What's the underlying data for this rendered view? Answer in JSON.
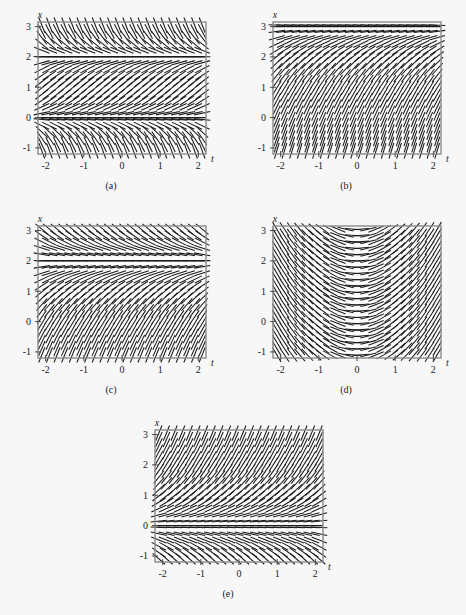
{
  "figure": {
    "background_color": "#f7f7f8",
    "frame_color": "#8a8a8a",
    "segment_color": "#1a1a1a",
    "axis_label_x": "x",
    "axis_label_t": "t"
  },
  "axes": {
    "x_ticks": [
      "-2",
      "-1",
      "0",
      "1",
      "2"
    ],
    "x_tick_values": [
      -2,
      -1,
      0,
      1,
      2
    ],
    "y_ticks": [
      "-1",
      "0",
      "1",
      "2",
      "3"
    ],
    "y_tick_values": [
      -1,
      0,
      1,
      2,
      3
    ],
    "xlim": [
      -2.2,
      2.2
    ],
    "ylim": [
      -1.2,
      3.15
    ],
    "xlabel": "t",
    "ylabel": "x"
  },
  "panels": [
    {
      "id": "a",
      "caption": "(a)",
      "equilibria": [
        0,
        2
      ],
      "slope_rule": "x(2-x)",
      "description": "Horizontal equilibrium lines at x = 0 and x = 2; positive slopes between them, negative slopes above x = 2 and below x = 0."
    },
    {
      "id": "b",
      "caption": "(b)",
      "equilibria": [
        3
      ],
      "slope_rule": "3-x",
      "description": "Single equilibrium line at x = 3; steep positive slopes everywhere below, flattening toward x = 3."
    },
    {
      "id": "c",
      "caption": "(c)",
      "equilibria": [
        2
      ],
      "slope_rule": "2-x",
      "description": "Single equilibrium line at x = 2; positive slopes below, negative slopes above."
    },
    {
      "id": "d",
      "caption": "(d)",
      "equilibria": [],
      "slope_rule": "t",
      "description": "Slopes depend only on t: negative for t < 0, flat at t = 0, positive for t > 0; independent of x."
    },
    {
      "id": "e",
      "caption": "(e)",
      "equilibria": [
        0
      ],
      "slope_rule": "x",
      "description": "Single equilibrium line at x = 0; positive slopes above, negative slopes below."
    }
  ],
  "chart_data": {
    "type": "scatter",
    "xlabel": "t",
    "ylabel": "x",
    "xlim": [
      -2.2,
      2.2
    ],
    "ylim": [
      -1.2,
      3.15
    ],
    "grid": false,
    "legend": "none",
    "x_tick_labels": [
      "-2",
      "-1",
      "0",
      "1",
      "2"
    ],
    "y_tick_labels": [
      "-1",
      "0",
      "1",
      "2",
      "3"
    ],
    "series": [
      {
        "name": "(a)",
        "slope_rule": "x*(2-x)",
        "equilibria": [
          0,
          2
        ]
      },
      {
        "name": "(b)",
        "slope_rule": "3-x",
        "equilibria": [
          3
        ]
      },
      {
        "name": "(c)",
        "slope_rule": "2-x",
        "equilibria": [
          2
        ]
      },
      {
        "name": "(d)",
        "slope_rule": "t",
        "equilibria": []
      },
      {
        "name": "(e)",
        "slope_rule": "x",
        "equilibria": [
          0
        ]
      }
    ]
  }
}
